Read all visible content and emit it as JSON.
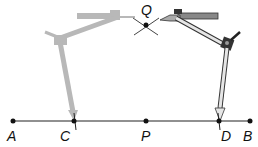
{
  "diagram": {
    "line": {
      "from": "A",
      "to": "B"
    },
    "points": [
      {
        "id": "A",
        "label": "A",
        "x": 13,
        "y": 121
      },
      {
        "id": "C",
        "label": "C",
        "x": 74,
        "y": 121
      },
      {
        "id": "P",
        "label": "P",
        "x": 146,
        "y": 121
      },
      {
        "id": "D",
        "label": "D",
        "x": 219,
        "y": 121
      },
      {
        "id": "B",
        "label": "B",
        "x": 250,
        "y": 121
      },
      {
        "id": "Q",
        "label": "Q",
        "x": 146,
        "y": 25
      }
    ],
    "colors": {
      "line": "#222222",
      "ghost_compass": "#b8b8b8",
      "compass_dark": "#333333",
      "compass_light": "#e6e6e6"
    }
  }
}
